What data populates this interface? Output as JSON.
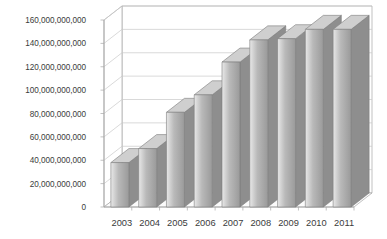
{
  "chart_data": {
    "type": "bar",
    "title": "",
    "subtitle": "",
    "xlabel": "",
    "ylabel": "",
    "categories": [
      "2003",
      "2004",
      "2005",
      "2006",
      "2007",
      "2008",
      "2009",
      "2010",
      "2011"
    ],
    "values": [
      38000000000,
      50000000000,
      81000000000,
      96000000000,
      124000000000,
      143000000000,
      144000000000,
      152000000000,
      152000000000
    ],
    "ylim": [
      0,
      160000000000
    ],
    "ytick_values": [
      0,
      20000000000,
      40000000000,
      60000000000,
      80000000000,
      100000000000,
      120000000000,
      140000000000,
      160000000000
    ],
    "ytick_labels": [
      "0",
      "20,000,000,000",
      "40,000,000,000",
      "60,000,000,000",
      "80,000,000,000",
      "100,000,000,000",
      "120,000,000,000",
      "140,000,000,000",
      "160,000,000,000"
    ],
    "grid": true,
    "legend": false,
    "legend_position": "none",
    "series": [
      {
        "name": "",
        "values": [
          38000000000,
          50000000000,
          81000000000,
          96000000000,
          124000000000,
          143000000000,
          144000000000,
          152000000000,
          152000000000
        ]
      }
    ],
    "annotations": [],
    "style": {
      "three_d": true,
      "bar_fill_light": "#e8e8e8",
      "bar_fill_mid": "#b9b9b9",
      "bar_fill_dark": "#9a9a9a",
      "bar_side": "#8e8e8e",
      "bar_top": "#cfcfcf",
      "bar_outline": "#7d7d7d",
      "grid_color": "#c9c9c9",
      "axis_color": "#a8a8a8",
      "wall_color": "#ffffff",
      "floor_color": "#fbfbfb",
      "text_color": "#3b3b3b",
      "background": "#ffffff"
    }
  }
}
